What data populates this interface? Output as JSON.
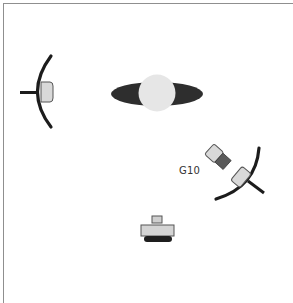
{
  "diagram": {
    "type": "lighting-setup",
    "colors": {
      "frame_border": "#8f8f8f",
      "stroke_dark": "#1c1c1c",
      "light_fill": "#d9d9d9",
      "body_dark": "#5a5a5a",
      "subject_plate": "#2e2e2e",
      "subject_head": "#e6e6e6"
    },
    "elements": [
      {
        "id": "left-light",
        "kind": "light-with-reflector",
        "position": "left"
      },
      {
        "id": "subject",
        "kind": "subject-top-view",
        "position": "center"
      },
      {
        "id": "right-light",
        "kind": "light-with-reflector",
        "position": "right-lower",
        "label": "G10"
      },
      {
        "id": "camera",
        "kind": "camera",
        "position": "bottom-center"
      }
    ],
    "labels": {
      "right_light_label": "G10"
    }
  }
}
